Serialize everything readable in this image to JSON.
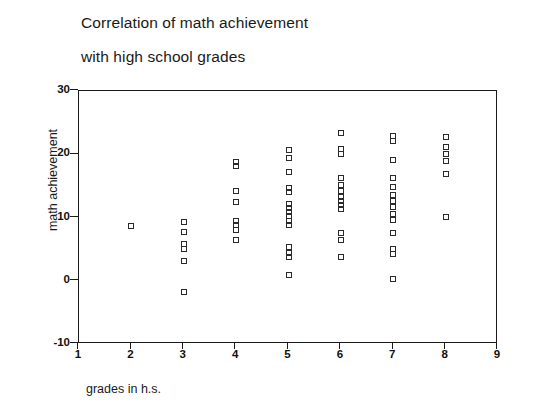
{
  "chart_data": {
    "type": "scatter",
    "title": "Correlation of math achievement with high school grades",
    "title_lines": [
      "Correlation of math achievement",
      "with high school grades"
    ],
    "xlabel": "grades in h.s.",
    "ylabel": "math achievement",
    "xlim": [
      1,
      9
    ],
    "ylim": [
      -10,
      30
    ],
    "xticks": [
      1,
      2,
      3,
      4,
      5,
      6,
      7,
      8,
      9
    ],
    "yticks": [
      -10,
      0,
      10,
      20,
      30
    ],
    "grid": false,
    "legend": null,
    "marker": "open-square",
    "marker_color": "#2a2a2a",
    "series": [
      {
        "name": "students",
        "x": [
          2,
          3,
          3,
          3,
          3,
          3,
          3,
          4,
          4,
          4,
          4,
          4,
          4,
          4,
          4,
          5,
          5,
          5,
          5,
          5,
          5,
          5,
          5,
          5,
          5,
          5,
          5,
          5,
          5,
          5,
          6,
          6,
          6,
          6,
          6,
          6,
          6,
          6,
          6,
          6,
          6,
          6,
          6,
          7,
          7,
          7,
          7,
          7,
          7,
          7,
          7,
          7,
          7,
          7,
          7,
          7,
          7,
          8,
          8,
          8,
          8,
          8,
          8
        ],
        "y": [
          8.6,
          9.3,
          7.7,
          5.8,
          5.0,
          3.2,
          -1.8,
          18.8,
          18.2,
          14.2,
          12.5,
          9.4,
          8.8,
          8.1,
          6.4,
          20.7,
          19.4,
          17.2,
          14.7,
          14.1,
          12.2,
          11.5,
          10.9,
          10.2,
          9.5,
          8.8,
          5.3,
          4.4,
          3.8,
          0.9,
          23.4,
          20.8,
          20.1,
          16.2,
          15.2,
          14.2,
          13.3,
          12.6,
          11.9,
          11.3,
          7.5,
          6.5,
          3.8,
          22.9,
          22.1,
          19.1,
          16.2,
          14.9,
          13.6,
          12.6,
          11.6,
          10.6,
          9.6,
          7.5,
          5.0,
          4.3,
          0.3,
          22.8,
          21.2,
          20.1,
          18.9,
          16.9,
          10.1
        ]
      }
    ]
  }
}
